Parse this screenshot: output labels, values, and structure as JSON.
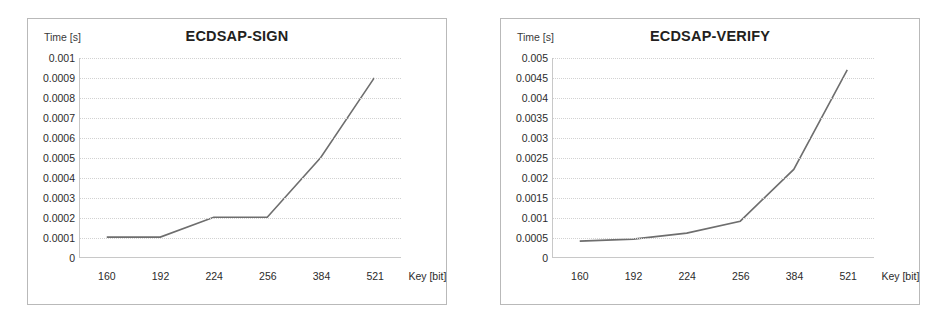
{
  "figure": {
    "panel_count": 2,
    "background_color": "#ffffff",
    "line_color": "#6e6e6e",
    "frame_color": "#b9b9b9",
    "grid_color": "#d2d2d2"
  },
  "chart_data": [
    {
      "type": "line",
      "title": "ECDSAP-SIGN",
      "xlabel": "Key [bit]",
      "ylabel": "Time [s]",
      "categories": [
        "160",
        "192",
        "224",
        "256",
        "384",
        "521"
      ],
      "values": [
        0.0001,
        0.0001,
        0.0002,
        0.0002,
        0.0005,
        0.0009
      ],
      "ylim": [
        0,
        0.001
      ],
      "ytick_labels": [
        "0.001",
        "0.0009",
        "0.0008",
        "0.0007",
        "0.0006",
        "0.0005",
        "0.0004",
        "0.0003",
        "0.0002",
        "0.0001",
        "0"
      ],
      "ytick_values": [
        0.001,
        0.0009,
        0.0008,
        0.0007,
        0.0006,
        0.0005,
        0.0004,
        0.0003,
        0.0002,
        0.0001,
        0
      ],
      "grid": true,
      "legend": "none",
      "series_color": "#6e6e6e"
    },
    {
      "type": "line",
      "title": "ECDSAP-VERIFY",
      "xlabel": "Key [bit]",
      "ylabel": "Time [s]",
      "categories": [
        "160",
        "192",
        "224",
        "256",
        "384",
        "521"
      ],
      "values": [
        0.0004,
        0.00045,
        0.0006,
        0.0009,
        0.0022,
        0.0047
      ],
      "ylim": [
        0,
        0.005
      ],
      "ytick_labels": [
        "0.005",
        "0.0045",
        "0.004",
        "0.0035",
        "0.003",
        "0.0025",
        "0.002",
        "0.0015",
        "0.001",
        "0.0005",
        "0"
      ],
      "ytick_values": [
        0.005,
        0.0045,
        0.004,
        0.0035,
        0.003,
        0.0025,
        0.002,
        0.0015,
        0.001,
        0.0005,
        0
      ],
      "grid": true,
      "legend": "none",
      "series_color": "#6e6e6e"
    }
  ]
}
